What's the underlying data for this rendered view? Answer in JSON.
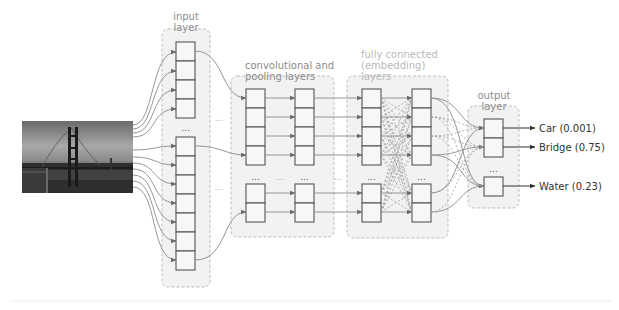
{
  "diagram": {
    "type": "convolutional-neural-network",
    "input_image": {
      "description": "grayscale photo of Golden Gate Bridge"
    },
    "layers": {
      "input": {
        "label_line1": "input",
        "label_line2": "layer",
        "upper_units": 4,
        "lower_units": 7,
        "ellipsis": "..."
      },
      "conv": {
        "label_line1": "convolutional and",
        "label_line2": "pooling layers",
        "columns": 2,
        "upper_units": 4,
        "lower_units": 2,
        "ellipsis": "..."
      },
      "fc": {
        "label_line1": "fully connected",
        "label_line2": "(embedding)",
        "label_line3": "layers",
        "columns": 2,
        "upper_units": 4,
        "lower_units": 2,
        "ellipsis": "..."
      },
      "output": {
        "label_line1": "output",
        "label_line2": "layer",
        "ellipsis": "..."
      }
    },
    "between_ellipsis": "...",
    "outputs": [
      {
        "class": "Car",
        "score": "0.001",
        "text": "Car (0.001)"
      },
      {
        "class": "Bridge",
        "score": "0.75",
        "text": "Bridge (0.75)"
      },
      {
        "class": "Water",
        "score": "0.23",
        "text": "Water (0.23)"
      }
    ],
    "colors": {
      "container_fill": "#f2f2f2",
      "container_border": "#bdbdbd",
      "unit_border": "#555555",
      "wire": "#8a8a8a",
      "label": "#8c8c8c",
      "output_text": "#333333"
    }
  }
}
